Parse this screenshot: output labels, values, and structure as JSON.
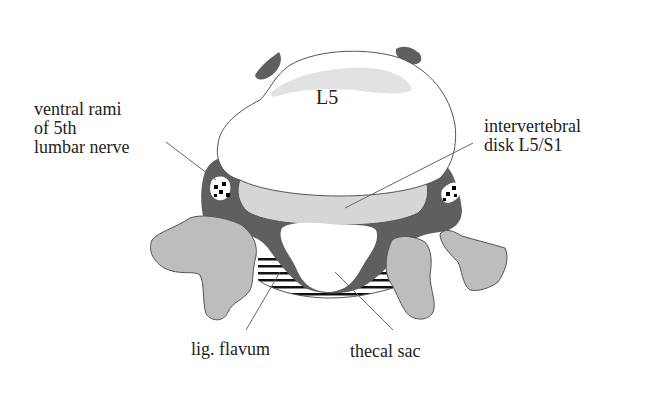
{
  "diagram": {
    "vertebra_label": "L5",
    "labels": {
      "ventral_rami": {
        "lines": [
          "ventral rami",
          "of 5th",
          "lumbar nerve"
        ]
      },
      "disk": {
        "lines": [
          "intervertebral",
          "disk L5/S1"
        ]
      },
      "lig_flavum": "lig. flavum",
      "thecal_sac": "thecal sac"
    },
    "colors": {
      "background": "#ffffff",
      "vertebral_body": "#ffffff",
      "vertebral_body_inner": "#e2e2e2",
      "dark_tissue": "#5f5f5f",
      "disk": "#d6d6d6",
      "facets": "#bdbdbd",
      "outline": "#555555",
      "leader_line": "#666666",
      "hatch": "#111111",
      "text": "#222222"
    }
  }
}
